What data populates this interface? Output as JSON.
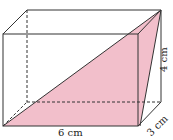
{
  "diagram": {
    "type": "rectangular prism with shaded diagonal plane",
    "labels": {
      "length": "6 cm",
      "height": "4 cm",
      "depth": "3 cm"
    },
    "colors": {
      "shade": "#f2bfcb",
      "edge": "#333333"
    }
  }
}
